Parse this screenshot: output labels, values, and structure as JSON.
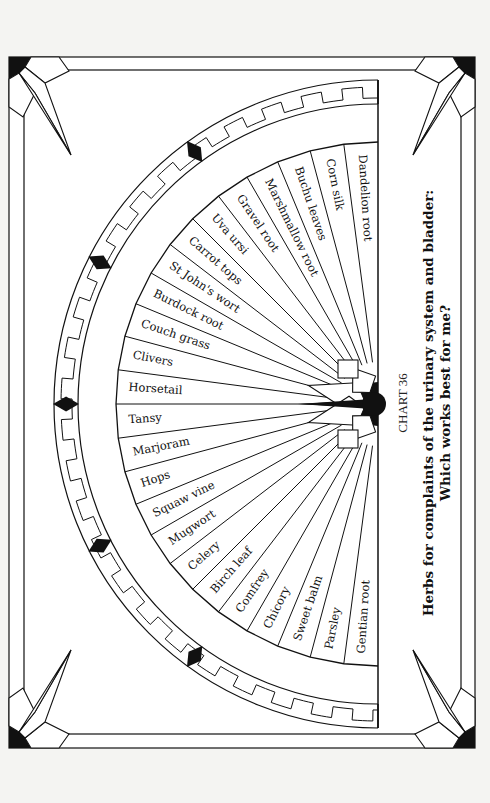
{
  "chart_data": {
    "type": "diagram",
    "chart_number": "CHART 36",
    "title": "Herbs for complaints of the urinary system and bladder:",
    "subtitle": "Which works best for me?",
    "layout": "semicircular fan of 26 equal segments radiating from a hub, framed by a stepped-key border ring and an ornamental rectangular frame",
    "segments": [
      "Dandelion root",
      "Corn silk",
      "Buchu leaves",
      "Marshmallow root",
      "Gravel root",
      "Uva ursi",
      "Carrot tops",
      "St John's wort",
      "Burdock root",
      "Couch grass",
      "Clivers",
      "Horsetail",
      "Tansy",
      "Marjoram",
      "Hops",
      "Squaw vine",
      "Mugwort",
      "Celery",
      "Birch leaf",
      "Comfrey",
      "Chicory",
      "Sweet balm",
      "Parsley",
      "Gentian root"
    ]
  },
  "colors": {
    "ink": "#111111",
    "paper": "#ffffff",
    "page": "#f4f4f2"
  }
}
